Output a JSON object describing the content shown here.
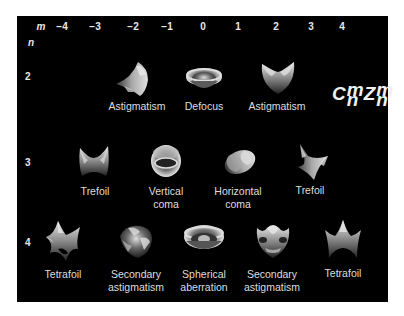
{
  "figure": {
    "axis_m_label": "m",
    "axis_n_label": "n",
    "m_values": [
      "−4",
      "−3",
      "−2",
      "−1",
      "0",
      "1",
      "2",
      "3",
      "4"
    ],
    "n_values": [
      "2",
      "3",
      "4"
    ],
    "formula": {
      "C": "C",
      "Z": "Z",
      "sup": "m",
      "sub": "n"
    },
    "colors": {
      "background": "#000000",
      "border": "#ffffff",
      "text": "#e0e0e0"
    },
    "rows": [
      {
        "n": "2",
        "terms": [
          {
            "m": "−2",
            "label": "Astigmatism",
            "shape": "astigmatism-oblique-icon"
          },
          {
            "m": "0",
            "label": "Defocus",
            "shape": "defocus-icon"
          },
          {
            "m": "2",
            "label": "Astigmatism",
            "shape": "astigmatism-vertical-icon"
          }
        ]
      },
      {
        "n": "3",
        "terms": [
          {
            "m": "−3",
            "label": "Trefoil",
            "shape": "trefoil-oblique-icon"
          },
          {
            "m": "−1",
            "label": "Vertical",
            "label2": "coma",
            "shape": "vertical-coma-icon"
          },
          {
            "m": "1",
            "label": "Horizontal",
            "label2": "coma",
            "shape": "horizontal-coma-icon"
          },
          {
            "m": "3",
            "label": "Trefoil",
            "shape": "trefoil-vertical-icon"
          }
        ]
      },
      {
        "n": "4",
        "terms": [
          {
            "m": "−4",
            "label": "Tetrafoil",
            "shape": "tetrafoil-oblique-icon"
          },
          {
            "m": "−2",
            "label": "Secondary",
            "label2": "astigmatism",
            "shape": "secondary-astigmatism-oblique-icon"
          },
          {
            "m": "0",
            "label": "Spherical",
            "label2": "aberration",
            "shape": "spherical-aberration-icon"
          },
          {
            "m": "2",
            "label": "Secondary",
            "label2": "astigmatism",
            "shape": "secondary-astigmatism-vertical-icon"
          },
          {
            "m": "4",
            "label": "Tetrafoil",
            "shape": "tetrafoil-vertical-icon"
          }
        ]
      }
    ]
  }
}
